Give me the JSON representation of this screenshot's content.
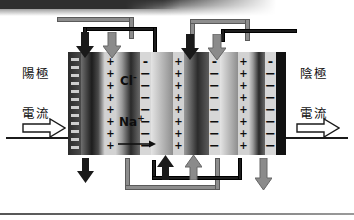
{
  "diagram": {
    "labels": {
      "anode": "陽極",
      "cathode": "陰極",
      "current_left": "電流",
      "current_right": "電流",
      "ion_chloride": "Cl",
      "ion_chloride_charge": "-",
      "ion_sodium": "Na",
      "ion_sodium_charge": "+"
    },
    "colors": {
      "background": "#ffffff",
      "electrode_dark": "#1b1b1b",
      "pipe_gray": "#8d8d8d",
      "pipe_black": "#1d1d1d",
      "membrane": "#d2d2d2",
      "text": "#111111"
    },
    "membranes": [
      {
        "name": "cation-membrane-1",
        "marker": "+"
      },
      {
        "name": "anion-membrane-1",
        "marker": "-"
      },
      {
        "name": "cation-membrane-2",
        "marker": "+"
      },
      {
        "name": "anion-membrane-2",
        "marker": "-"
      },
      {
        "name": "cation-membrane-3",
        "marker": "+"
      },
      {
        "name": "anion-membrane-3",
        "marker": "-"
      }
    ],
    "electrodes": [
      {
        "name": "anode-plate",
        "polarity": "-"
      },
      {
        "name": "cathode-plate",
        "polarity": "-"
      }
    ],
    "flow_arrows": [
      {
        "name": "feed-in-top-black-left",
        "direction": "down",
        "color": "black"
      },
      {
        "name": "feed-in-top-gray-left",
        "direction": "down",
        "color": "gray"
      },
      {
        "name": "feed-in-top-black-right",
        "direction": "down",
        "color": "black"
      },
      {
        "name": "feed-in-top-gray-right",
        "direction": "down",
        "color": "gray"
      },
      {
        "name": "outflow-bottom-black-left",
        "direction": "down",
        "color": "black"
      },
      {
        "name": "recirc-bottom-black",
        "direction": "up",
        "color": "black"
      },
      {
        "name": "recirc-bottom-gray",
        "direction": "up",
        "color": "gray"
      },
      {
        "name": "outflow-bottom-gray-right",
        "direction": "down",
        "color": "gray"
      }
    ],
    "ion_flow_arrow": {
      "name": "ion-migration-arrow",
      "direction": "right"
    }
  }
}
